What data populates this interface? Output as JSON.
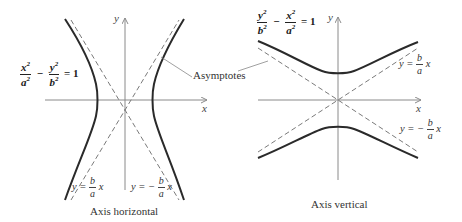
{
  "figure": {
    "colors": {
      "curve": "#2a2a2a",
      "axes": "#8a8a8a",
      "asymptote": "#7a7a7a",
      "text": "#333333"
    }
  },
  "left_panel": {
    "caption": "Axis horizontal",
    "equation": {
      "term1_num": "x",
      "term1_num_exp": "2",
      "term1_den": "a",
      "term1_den_exp": "2",
      "operator": "−",
      "term2_num": "y",
      "term2_num_exp": "2",
      "term2_den": "b",
      "term2_den_exp": "2",
      "rhs": "= 1"
    },
    "axis_x_label": "x",
    "axis_y_label": "y",
    "asymptote_pos": {
      "prefix": "y =",
      "num": "b",
      "den": "a",
      "suffix": "x"
    },
    "asymptote_neg": {
      "prefix": "y = −",
      "num": "b",
      "den": "a",
      "suffix": "x"
    }
  },
  "right_panel": {
    "caption": "Axis vertical",
    "equation": {
      "term1_num": "y",
      "term1_num_exp": "2",
      "term1_den": "b",
      "term1_den_exp": "2",
      "operator": "−",
      "term2_num": "x",
      "term2_num_exp": "2",
      "term2_den": "a",
      "term2_den_exp": "2",
      "rhs": "= 1"
    },
    "axis_x_label": "x",
    "axis_y_label": "y",
    "asymptote_pos": {
      "prefix": "y =",
      "num": "b",
      "den": "a",
      "suffix": "x"
    },
    "asymptote_neg": {
      "prefix": "y = −",
      "num": "b",
      "den": "a",
      "suffix": "x"
    }
  },
  "shared": {
    "asymptotes_label": "Asymptotes"
  }
}
